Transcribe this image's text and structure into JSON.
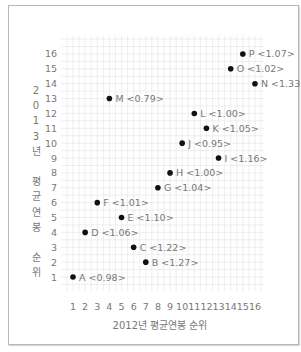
{
  "chart_data": {
    "type": "scatter",
    "title": "",
    "xlabel": "2012년 평균연봉 순위",
    "ylabel": "2013년 평균연봉 순위",
    "ylabel_chars": [
      "2",
      "0",
      "1",
      "3",
      "년",
      "",
      "평",
      "균",
      "연",
      "봉",
      "",
      "순",
      "위"
    ],
    "x_ticks": [
      1,
      2,
      3,
      4,
      5,
      6,
      7,
      8,
      9,
      10,
      11,
      12,
      13,
      14,
      15,
      16
    ],
    "y_ticks": [
      1,
      2,
      3,
      4,
      5,
      6,
      7,
      8,
      9,
      10,
      11,
      12,
      13,
      14,
      15,
      16
    ],
    "xlim": [
      0,
      17
    ],
    "ylim": [
      0,
      17
    ],
    "grid": true,
    "legend": null,
    "points": [
      {
        "label": "A",
        "value": "0.98",
        "x": 1,
        "y": 1
      },
      {
        "label": "B",
        "value": "1.27",
        "x": 7,
        "y": 2
      },
      {
        "label": "C",
        "value": "1.22",
        "x": 6,
        "y": 3
      },
      {
        "label": "D",
        "value": "1.06",
        "x": 2,
        "y": 4
      },
      {
        "label": "E",
        "value": "1.10",
        "x": 5,
        "y": 5
      },
      {
        "label": "F",
        "value": "1.01",
        "x": 3,
        "y": 6
      },
      {
        "label": "G",
        "value": "1.04",
        "x": 8,
        "y": 7
      },
      {
        "label": "H",
        "value": "1.00",
        "x": 9,
        "y": 8
      },
      {
        "label": "I",
        "value": "1.16",
        "x": 13,
        "y": 9
      },
      {
        "label": "J",
        "value": "0.95",
        "x": 10,
        "y": 10
      },
      {
        "label": "K",
        "value": "1.05",
        "x": 12,
        "y": 11
      },
      {
        "label": "L",
        "value": "1.00",
        "x": 11,
        "y": 12
      },
      {
        "label": "M",
        "value": "0.79",
        "x": 4,
        "y": 13
      },
      {
        "label": "N",
        "value": "1.33",
        "x": 16,
        "y": 14
      },
      {
        "label": "O",
        "value": "1.02",
        "x": 14,
        "y": 15
      },
      {
        "label": "P",
        "value": "1.07",
        "x": 15,
        "y": 16
      }
    ]
  },
  "style": {
    "grid_color": "#e6e6e6",
    "point_color": "#111111",
    "text_color": "#777777",
    "frame_color": "#b8b8b8"
  }
}
